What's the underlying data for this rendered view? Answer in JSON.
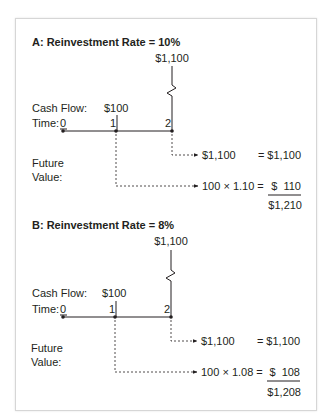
{
  "panels": [
    {
      "id": "A",
      "title": "A: Reinvestment Rate = 10%",
      "final_cash_flow": "$1,100",
      "cash_flow_label": "Cash Flow:",
      "cash_flow_value": "$100",
      "time_label": "Time:",
      "time_points": [
        "0",
        "1",
        "2"
      ],
      "future_value_label_line1": "Future",
      "future_value_label_line2": "Value:",
      "row1_left": "$1,100",
      "row1_right": "= $1,100",
      "row2_left": "100 × 1.10 =",
      "row2_right": "$  110",
      "total": "$1,210"
    },
    {
      "id": "B",
      "title": "B: Reinvestment Rate = 8%",
      "final_cash_flow": "$1,100",
      "cash_flow_label": "Cash Flow:",
      "cash_flow_value": "$100",
      "time_label": "Time:",
      "time_points": [
        "0",
        "1",
        "2"
      ],
      "future_value_label_line1": "Future",
      "future_value_label_line2": "Value:",
      "row1_left": "$1,100",
      "row1_right": "= $1,100",
      "row2_left": "100 × 1.08 =",
      "row2_right": "$  108",
      "total": "$1,208"
    }
  ]
}
